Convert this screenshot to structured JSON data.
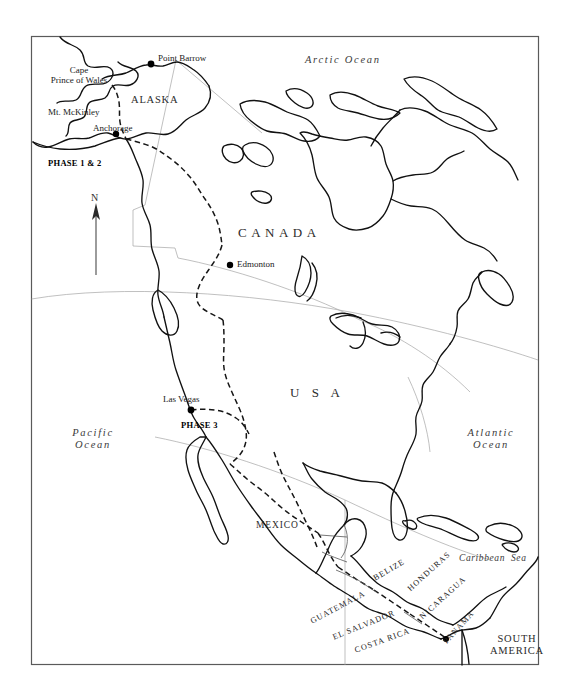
{
  "map": {
    "title": "North America",
    "frame": {
      "stroke": "#5a5a5a"
    },
    "colors": {
      "coastline": "#111111",
      "internal_border": "#1a1a1a",
      "graticule": "#9a9a9a",
      "label": "#2b2b2b",
      "background": "#ffffff"
    },
    "oceans": [
      {
        "name": "arctic-ocean",
        "label": "Arctic Ocean"
      },
      {
        "name": "pacific-ocean",
        "label": "Pacific\nOcean"
      },
      {
        "name": "atlantic-ocean",
        "label": "Atlantic\nOcean"
      },
      {
        "name": "caribbean-sea",
        "label": "Caribbean  Sea"
      }
    ],
    "countries": [
      {
        "name": "canada",
        "label": "CANADA"
      },
      {
        "name": "usa",
        "label": "U S A"
      },
      {
        "name": "mexico",
        "label": "MEXICO"
      },
      {
        "name": "alaska",
        "label": "ALASKA"
      },
      {
        "name": "south-america",
        "label": "SOUTH\nAMERICA"
      }
    ],
    "central_america": [
      {
        "name": "belize",
        "label": "BELIZE"
      },
      {
        "name": "honduras",
        "label": "HONDURAS"
      },
      {
        "name": "nicaragua",
        "label": "NICARAGUA"
      },
      {
        "name": "panama",
        "label": "PANAMA"
      },
      {
        "name": "guatemala",
        "label": "GUATEMALA"
      },
      {
        "name": "el-salvador",
        "label": "EL SALVADOR"
      },
      {
        "name": "costa-rica",
        "label": "COSTA RICA"
      }
    ],
    "cities": [
      {
        "name": "point-barrow",
        "label": "Point Barrow"
      },
      {
        "name": "anchorage",
        "label": "Anchorage"
      },
      {
        "name": "edmonton",
        "label": "Edmonton"
      },
      {
        "name": "las-vegas",
        "label": "Las Vegas"
      }
    ],
    "landmarks": [
      {
        "name": "cape-prince-of-wales",
        "label": "Cape\nPrince of Wales"
      },
      {
        "name": "mount-mckinley",
        "label": "Mt. McKinley"
      }
    ],
    "phases": [
      {
        "name": "phase-1-2",
        "label": "PHASE 1 & 2"
      },
      {
        "name": "phase-3",
        "label": "PHASE 3"
      }
    ],
    "compass": {
      "label": "N"
    }
  }
}
